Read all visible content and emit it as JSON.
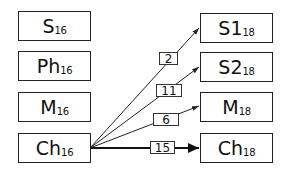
{
  "left_nodes": [
    {
      "main": "S",
      "sub": "16"
    },
    {
      "main": "Ph",
      "sub": "16"
    },
    {
      "main": "M",
      "sub": "16"
    },
    {
      "main": "Ch",
      "sub": "16"
    }
  ],
  "right_nodes": [
    {
      "main": "S1",
      "sub": "18"
    },
    {
      "main": "S2",
      "sub": "18"
    },
    {
      "main": "M",
      "sub": "18"
    },
    {
      "main": "Ch",
      "sub": "18"
    }
  ],
  "edges": [
    {
      "from": "Ch16",
      "to": "S118",
      "label": "2"
    },
    {
      "from": "Ch16",
      "to": "S218",
      "label": "11"
    },
    {
      "from": "Ch16",
      "to": "M18",
      "label": "6"
    },
    {
      "from": "Ch16",
      "to": "Ch18",
      "label": "15"
    }
  ],
  "colors": {
    "stroke": "#222222",
    "background": "#ffffff"
  }
}
